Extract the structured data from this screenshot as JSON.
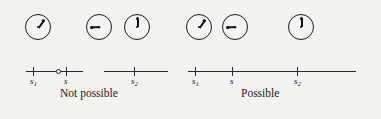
{
  "figure": {
    "background_color": "#f2f2f1",
    "ink_color": "#1a1a1a",
    "width": 381,
    "height": 119
  },
  "panels": [
    {
      "id": "not-possible",
      "caption": "Not possible",
      "caption_x": 60,
      "caption_y": 88,
      "clocks": [
        {
          "name": "clock-s1",
          "x": 25,
          "y": 14,
          "hand_angle_deg": 35,
          "reading": "hand pointing up-right, about 1 o'clock"
        },
        {
          "name": "clock-s",
          "x": 86,
          "y": 14,
          "hand_angle_deg": 270,
          "reading": "hand pointing left, 9 o'clock"
        },
        {
          "name": "clock-s2",
          "x": 124,
          "y": 14,
          "hand_angle_deg": 0,
          "reading": "hand pointing up, 12 o'clock"
        }
      ],
      "axis": {
        "continuous": false,
        "segments": [
          {
            "x1": 26,
            "x2": 83,
            "y": 71
          },
          {
            "x1": 104,
            "x2": 168,
            "y": 71
          }
        ],
        "ticks": [
          {
            "label": "s",
            "sub": "1",
            "x": 33,
            "y": 67,
            "label_x": 30,
            "label_y": 77
          },
          {
            "label": "s",
            "sub": "",
            "x": 66,
            "y": 67,
            "label_x": 64,
            "label_y": 77
          },
          {
            "label": "s",
            "sub": "2",
            "x": 134,
            "y": 67,
            "label_x": 131,
            "label_y": 77
          }
        ],
        "open_circles": [
          {
            "x": 56,
            "y": 69
          }
        ]
      }
    },
    {
      "id": "possible",
      "caption": "Possible",
      "caption_x": 241,
      "caption_y": 88,
      "clocks": [
        {
          "name": "clock-s1",
          "x": 186,
          "y": 14,
          "hand_angle_deg": 35,
          "reading": "hand pointing up-right, about 1 o'clock"
        },
        {
          "name": "clock-s",
          "x": 222,
          "y": 14,
          "hand_angle_deg": 270,
          "reading": "hand pointing left, 9 o'clock"
        },
        {
          "name": "clock-s2",
          "x": 288,
          "y": 14,
          "hand_angle_deg": 0,
          "reading": "hand pointing up, 12 o'clock"
        }
      ],
      "axis": {
        "continuous": true,
        "segments": [
          {
            "x1": 188,
            "x2": 356,
            "y": 71
          }
        ],
        "ticks": [
          {
            "label": "s",
            "sub": "1",
            "x": 195,
            "y": 67,
            "label_x": 192,
            "label_y": 77
          },
          {
            "label": "s",
            "sub": "",
            "x": 232,
            "y": 67,
            "label_x": 230,
            "label_y": 77
          },
          {
            "label": "s",
            "sub": "2",
            "x": 297,
            "y": 67,
            "label_x": 294,
            "label_y": 77
          }
        ],
        "open_circles": []
      }
    }
  ]
}
